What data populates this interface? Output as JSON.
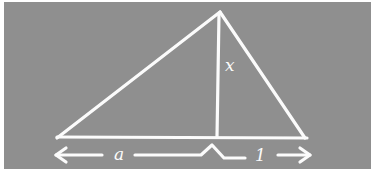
{
  "diagram": {
    "background_color": "#8f8f8f",
    "stroke_color": "#fbfbfb",
    "labels": {
      "altitude": "x",
      "left_segment": "a",
      "right_segment": "1"
    }
  }
}
